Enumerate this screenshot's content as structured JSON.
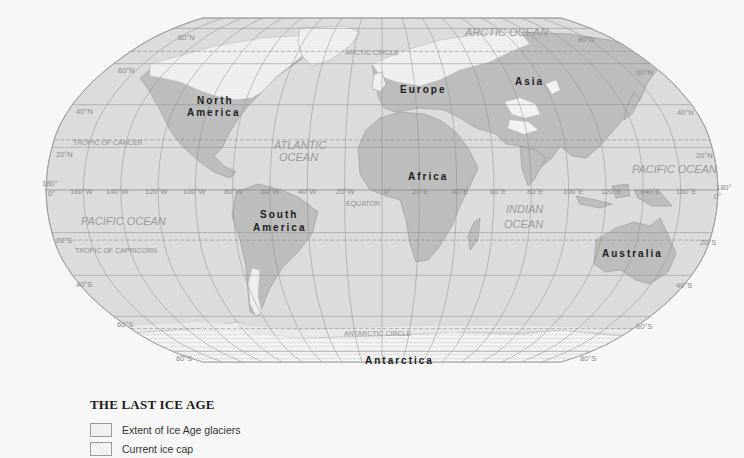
{
  "map": {
    "title": "THE LAST ICE AGE",
    "projection": "Robinson",
    "colors": {
      "ocean": "#dcdcdc",
      "land": "#bdbdbd",
      "glacier": "#f1f1f1",
      "ice_cap": "#f8f8f8",
      "graticule": "#8c8c8c",
      "background": "#f7f7f7"
    },
    "continents": [
      {
        "name": "North America",
        "line1": "North",
        "line2": "America"
      },
      {
        "name": "South America",
        "line1": "South",
        "line2": "America"
      },
      {
        "name": "Europe",
        "line1": "Europe"
      },
      {
        "name": "Asia",
        "line1": "Asia"
      },
      {
        "name": "Africa",
        "line1": "Africa"
      },
      {
        "name": "Australia",
        "line1": "Australia"
      },
      {
        "name": "Antarctica",
        "line1": "Antarctica"
      }
    ],
    "oceans": {
      "arctic": "ARCTIC OCEAN",
      "atlantic_1": "ATLANTIC",
      "atlantic_2": "OCEAN",
      "pacific_west": "PACIFIC OCEAN",
      "pacific_east": "PACIFIC OCEAN",
      "indian_1": "INDIAN",
      "indian_2": "OCEAN"
    },
    "special_lines": {
      "arctic_circle": "ARCTIC CIRCLE",
      "tropic_cancer": "TROPIC OF CANCER",
      "equator": "EQUATOR",
      "tropic_capricorn": "TROPIC OF CAPRICORN",
      "antarctic_circle": "ANTARCTIC CIRCLE"
    },
    "latitude_labels": {
      "n80_left": "80°N",
      "n80_right": "80°N",
      "n60_left": "60°N",
      "n60_right": "60°N",
      "n40_left": "40°N",
      "n40_right": "40°N",
      "n20_left": "20°N",
      "n20_right": "20°N",
      "eq_left": "0°",
      "eq_right": "0°",
      "s20_left": "20°S",
      "s20_right": "20°S",
      "s40_left": "40°S",
      "s40_right": "40°S",
      "s60_left": "60°S",
      "s60_right": "60°S",
      "s80_left": "80°S",
      "s80_right": "80°S",
      "dateline_left": "180°",
      "dateline_right": "180°"
    },
    "longitude_labels": [
      "160°W",
      "140°W",
      "120°W",
      "100°W",
      "80°W",
      "60°W",
      "40°W",
      "20°W",
      "0°",
      "20°E",
      "40°E",
      "60°E",
      "80°E",
      "100°E",
      "120°E",
      "140°E",
      "160°E"
    ]
  },
  "legend": {
    "title": "THE LAST ICE AGE",
    "items": [
      {
        "label": "Extent of Ice Age glaciers",
        "pattern": "glacier"
      },
      {
        "label": "Current ice cap",
        "pattern": "ice-cap"
      }
    ]
  }
}
